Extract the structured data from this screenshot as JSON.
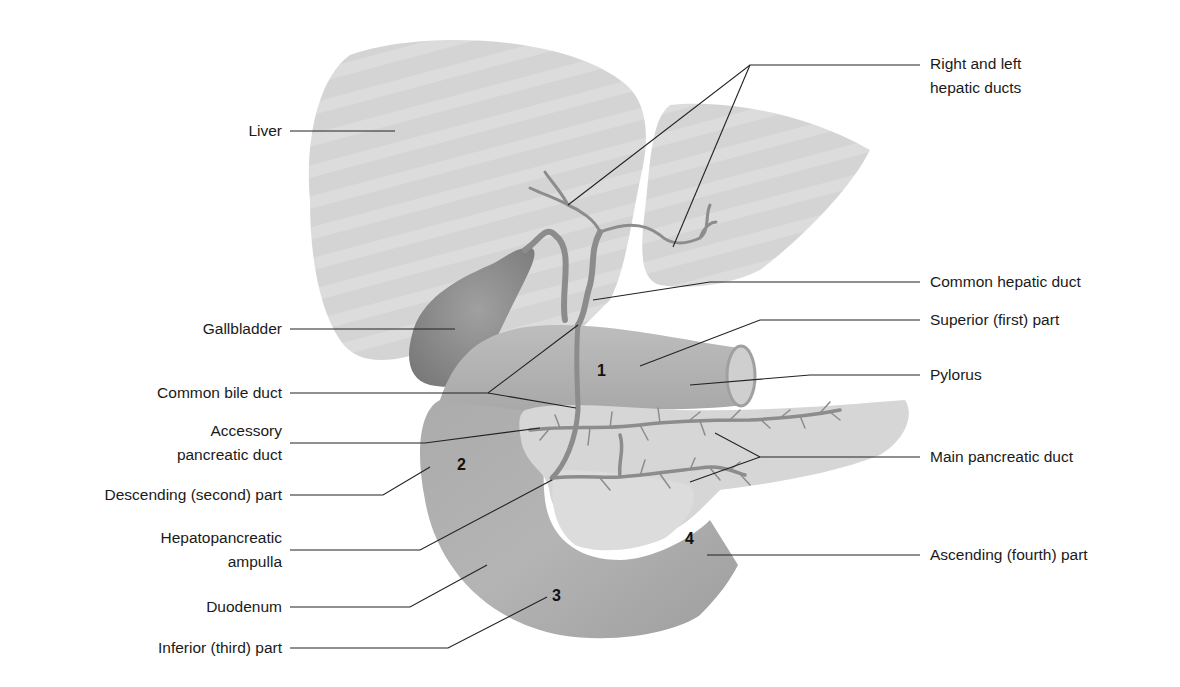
{
  "figure": {
    "colors": {
      "background": "#ffffff",
      "liver": "#d6d6d6",
      "gallbladder": "#8f8f8f",
      "duodenum": "#a8a8a8",
      "pancreas": "#d2d2d2",
      "ducts": "#8a8a8a",
      "leader_line": "#222222",
      "text": "#1a1a1a"
    }
  },
  "labels_left": [
    {
      "id": "liver",
      "text": "Liver"
    },
    {
      "id": "gallbladder",
      "text": "Gallbladder"
    },
    {
      "id": "common-bile-duct",
      "text": "Common bile duct"
    },
    {
      "id": "accessory-pancreatic-duct",
      "line1": "Accessory",
      "line2": "pancreatic duct"
    },
    {
      "id": "descending-part",
      "text": "Descending (second) part"
    },
    {
      "id": "hepatopancreatic-ampulla",
      "line1": "Hepatopancreatic",
      "line2": "ampulla"
    },
    {
      "id": "duodenum",
      "text": "Duodenum"
    },
    {
      "id": "inferior-part",
      "text": "Inferior (third) part"
    }
  ],
  "labels_right": [
    {
      "id": "hepatic-ducts",
      "line1": "Right and left",
      "line2": "hepatic ducts"
    },
    {
      "id": "common-hepatic-duct",
      "text": "Common hepatic duct"
    },
    {
      "id": "superior-part",
      "text": "Superior (first) part"
    },
    {
      "id": "pylorus",
      "text": "Pylorus"
    },
    {
      "id": "main-pancreatic-duct",
      "text": "Main pancreatic duct"
    },
    {
      "id": "ascending-part",
      "text": "Ascending (fourth) part"
    }
  ],
  "part_numbers": [
    "1",
    "2",
    "3",
    "4"
  ]
}
